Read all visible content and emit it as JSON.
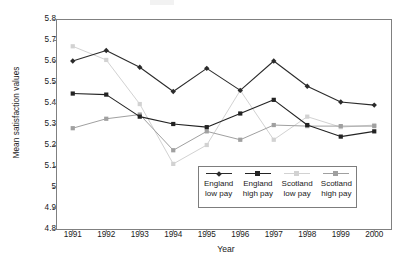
{
  "chart_data": {
    "type": "line",
    "title": "",
    "xlabel": "Year",
    "ylabel": "Mean satisfaction values",
    "categories": [
      "1991",
      "1992",
      "1993",
      "1994",
      "1995",
      "1996",
      "1997",
      "1998",
      "1999",
      "2000"
    ],
    "x": [
      1991,
      1992,
      1993,
      1994,
      1995,
      1996,
      1997,
      1998,
      1999,
      2000
    ],
    "ylim": [
      4.8,
      5.8
    ],
    "yticks": [
      "4.8",
      "4.9",
      "5",
      "5.1",
      "5.2",
      "5.3",
      "5.4",
      "5.5",
      "5.6",
      "5.7",
      "5.8"
    ],
    "ytick_values": [
      4.8,
      4.9,
      5.0,
      5.1,
      5.2,
      5.3,
      5.4,
      5.5,
      5.6,
      5.7,
      5.8
    ],
    "grid": false,
    "legend_position": "inside-lower-right",
    "series": [
      {
        "name": "England low pay",
        "label_line1": "England",
        "label_line2": "low pay",
        "color": "#2b2b2b",
        "marker": "diamond",
        "values": [
          5.6,
          5.65,
          5.57,
          5.455,
          5.565,
          5.46,
          5.6,
          5.48,
          5.405,
          5.39
        ]
      },
      {
        "name": "England high pay",
        "label_line1": "England",
        "label_line2": "high pay",
        "color": "#232323",
        "marker": "square",
        "values": [
          5.445,
          5.44,
          5.335,
          5.3,
          5.285,
          5.35,
          5.415,
          5.295,
          5.24,
          5.265
        ]
      },
      {
        "name": "Scotland low pay",
        "label_line1": "Scotland",
        "label_line2": "low pay",
        "color": "#d2d2d2",
        "marker": "square",
        "values": [
          5.67,
          5.605,
          5.395,
          5.11,
          5.2,
          5.46,
          5.225,
          5.335,
          5.285,
          5.295
        ]
      },
      {
        "name": "Scotland high pay",
        "label_line1": "Scotland",
        "label_line2": "high pay",
        "color": "#a0a0a0",
        "marker": "square",
        "values": [
          5.28,
          5.325,
          5.345,
          5.175,
          5.265,
          5.225,
          5.295,
          5.29,
          5.29,
          5.29
        ]
      }
    ]
  },
  "axes": {
    "frame_color": "#808080"
  }
}
